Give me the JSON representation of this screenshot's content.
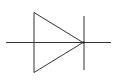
{
  "diagram": {
    "type": "electronic-schematic-symbol",
    "symbol": "diode",
    "stroke_color": "#333333",
    "background": "#ffffff",
    "parts": [
      "lead-line",
      "anode-triangle",
      "cathode-bar"
    ]
  }
}
